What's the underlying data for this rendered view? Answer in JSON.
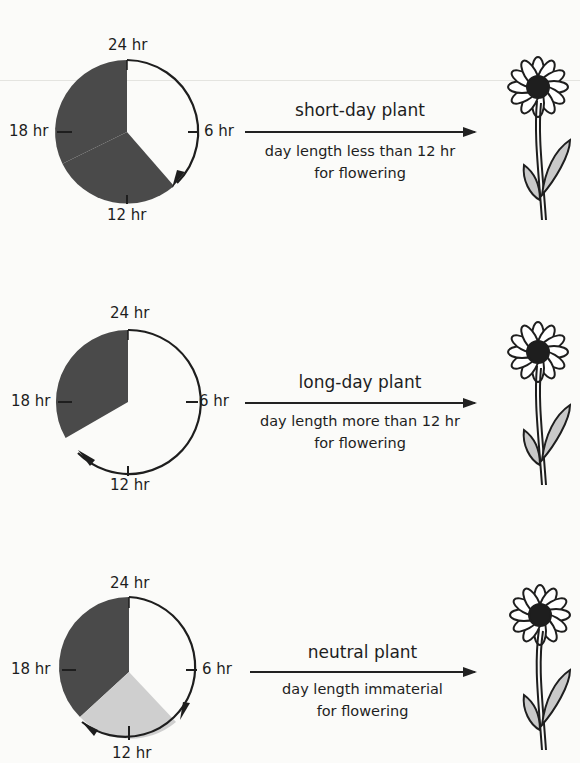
{
  "colors": {
    "night": "#4a4a4a",
    "twilight": "#cfcfcf",
    "line": "#1e1e1e",
    "background": "#fbfbf9"
  },
  "clock_labels": {
    "top": "24 hr",
    "right": "6 hr",
    "bottom": "12 hr",
    "left": "18 hr"
  },
  "rows": [
    {
      "name": "short-day plant",
      "description_line1": "day length less than 12 hr",
      "description_line2": "for flowering",
      "light_hours": 10,
      "dark_hours": 14
    },
    {
      "name": "long-day plant",
      "description_line1": "day length more than 12 hr",
      "description_line2": "for flowering",
      "light_hours": 16,
      "dark_hours": 8
    },
    {
      "name": "neutral plant",
      "description_line1": "day length immaterial",
      "description_line2": "for flowering",
      "light_hours": 10,
      "variable_hours": 6,
      "dark_hours": 8
    }
  ]
}
